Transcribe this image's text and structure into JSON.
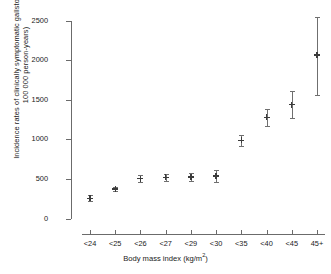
{
  "chart_data": {
    "type": "scatter",
    "title": "",
    "subtitle": "",
    "xlabel": "Body mass index (kg/m",
    "xlabel_sup": "2",
    "xlabel_tail": ")",
    "xlabel_full": "Body mass index (kg/m2)",
    "ylabel": "Incidence rates of clinically symptomatic gallstones (per 100 000 person-years)",
    "categories": [
      "<24",
      "<25",
      "<26",
      "<27",
      "<29",
      "<30",
      "<35",
      "<40",
      "<45",
      "45+"
    ],
    "values": [
      265,
      380,
      510,
      525,
      535,
      545,
      995,
      1285,
      1445,
      2075
    ],
    "error_low": [
      230,
      355,
      470,
      480,
      485,
      470,
      925,
      1175,
      1280,
      1570
    ],
    "error_high": [
      300,
      405,
      550,
      570,
      585,
      620,
      1065,
      1390,
      1620,
      2555
    ],
    "ylim": [
      0,
      2500
    ],
    "yticks": [
      0,
      500,
      1000,
      1500,
      2000,
      2500
    ],
    "ytick_labels": [
      "0",
      "500",
      "1000",
      "1500",
      "2000",
      "2500"
    ],
    "grid": false,
    "legend": false,
    "marker_style": "point-with-error-bars",
    "series_name": "Incidence rate"
  }
}
